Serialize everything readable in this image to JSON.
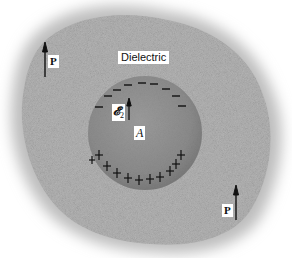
{
  "diagram": {
    "labels": {
      "dielectric": "Dielectric",
      "polarization_top": "P",
      "polarization_bottom": "P",
      "cavity": "A",
      "field_symbol": "𝓔",
      "field_subscript": "2"
    },
    "charges": {
      "top_surface": "−",
      "bottom_surface": "+",
      "negative_count": 9,
      "positive_count": 11
    },
    "colors": {
      "background": "#ffffff",
      "dielectric": "#b9b9b9",
      "cavity": "#8e8e8e",
      "ink": "#111111",
      "label_bg": "#ffffff"
    }
  }
}
